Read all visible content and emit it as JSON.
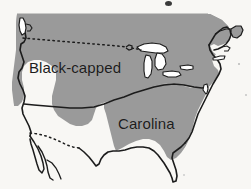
{
  "figure": {
    "name": "chickadee-range-map",
    "region_depicted": "United States",
    "background_color": "#f8f7f4",
    "width": 251,
    "height": 189
  },
  "map": {
    "outline_color": "#1a1a1a",
    "land_fill": "#ffffff",
    "water_fill": "#ffffff",
    "border_line_style": "dotted",
    "canada_border_label": "",
    "mexico_border_label": ""
  },
  "ranges": [
    {
      "id": "black-capped",
      "label": "Black-capped",
      "fill_color": "#9a9a9a",
      "label_color": "#1c1c1c",
      "coverage": "northern and western United States"
    },
    {
      "id": "carolina",
      "label": "Carolina",
      "fill_color": "#9a9a9a",
      "label_color": "#1c1c1c",
      "coverage": "southeastern United States"
    }
  ],
  "artifacts": {
    "top_ink_mark": "ink-blot",
    "edge_specks": "scan-specks"
  }
}
